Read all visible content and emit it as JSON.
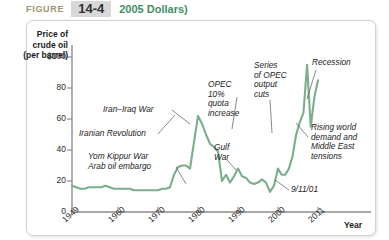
{
  "header": {
    "figure_word": "FIGURE",
    "figure_number": "14-4",
    "title": "2005 Dollars)",
    "colors": {
      "figure_word": "#9d9471",
      "figure_number_bg": "#d8d8d8",
      "title": "#3f8f66",
      "line": "#7aae8c"
    }
  },
  "chart_data": {
    "type": "line",
    "title": "2005 Dollars)",
    "xlabel": "Year",
    "ylabel": "Price of crude oil (per barrel)",
    "ylabel_lines": [
      "Price of",
      "crude oil",
      "(per barrel)"
    ],
    "ylim": [
      0,
      105
    ],
    "xlim": [
      1949,
      2011
    ],
    "yticks": [
      0,
      20,
      40,
      60,
      80,
      100
    ],
    "ytick_labels": [
      "0",
      "20",
      "40",
      "60",
      "80",
      "$100"
    ],
    "xticks": [
      1949,
      1960,
      1970,
      1980,
      1990,
      2000,
      2011
    ],
    "xtick_labels": [
      "1949",
      "1960",
      "1970",
      "1980",
      "1990",
      "2000",
      "2011"
    ],
    "grid": false,
    "legend": "none",
    "series": [
      {
        "name": "Real price of crude oil (2005 dollars per barrel)",
        "color": "#7aae8c",
        "x": [
          1949,
          1950,
          1951,
          1952,
          1953,
          1954,
          1955,
          1956,
          1957,
          1958,
          1959,
          1960,
          1961,
          1962,
          1963,
          1964,
          1965,
          1966,
          1967,
          1968,
          1969,
          1970,
          1971,
          1972,
          1973,
          1974,
          1975,
          1976,
          1977,
          1978,
          1979,
          1980,
          1981,
          1982,
          1983,
          1984,
          1985,
          1986,
          1987,
          1988,
          1989,
          1990,
          1991,
          1992,
          1993,
          1994,
          1995,
          1996,
          1997,
          1998,
          1999,
          2000,
          2001,
          2002,
          2003,
          2004,
          2005,
          2006,
          2007,
          2008,
          2009,
          2010,
          2011
        ],
        "y": [
          17,
          16,
          15,
          15,
          16,
          16,
          16,
          16,
          17,
          16,
          15,
          15,
          15,
          15,
          15,
          14,
          14,
          14,
          14,
          14,
          14,
          14,
          15,
          15,
          16,
          24,
          29,
          30,
          30,
          28,
          45,
          62,
          57,
          50,
          44,
          42,
          39,
          20,
          24,
          19,
          23,
          28,
          23,
          22,
          19,
          18,
          19,
          21,
          19,
          13,
          17,
          28,
          24,
          24,
          28,
          36,
          50,
          58,
          64,
          95,
          55,
          74,
          85
        ]
      }
    ],
    "annotations": [
      {
        "id": "yom-kippur",
        "text": "Yom Kippur War\nArab oil embargo",
        "lines": [
          "Yom Kippur War",
          "Arab oil embargo"
        ],
        "year": 1973,
        "value": 24
      },
      {
        "id": "iranian-revolution",
        "text": "Iranian Revolution",
        "lines": [
          "Iranian Revolution"
        ],
        "year": 1979,
        "value": 45
      },
      {
        "id": "iran-iraq-war",
        "text": "Iran–Iraq War",
        "lines": [
          "Iran–Iraq War"
        ],
        "year": 1980,
        "value": 62
      },
      {
        "id": "opec-quota",
        "text": "OPEC 10% quota increase",
        "lines": [
          "OPEC",
          "10%",
          "quota",
          "increase"
        ],
        "year": 1986,
        "value": 20
      },
      {
        "id": "gulf-war",
        "text": "Gulf War",
        "lines": [
          "Gulf",
          "War"
        ],
        "year": 1990,
        "value": 28
      },
      {
        "id": "opec-cuts",
        "text": "Series of OPEC output cuts",
        "lines": [
          "Series",
          "of OPEC",
          "output",
          "cuts"
        ],
        "year": 1999,
        "value": 17
      },
      {
        "id": "nine-eleven",
        "text": "9/11/01",
        "lines": [
          "9/11/01"
        ],
        "year": 2001,
        "value": 24
      },
      {
        "id": "recession",
        "text": "Recession",
        "lines": [
          "Recession"
        ],
        "year": 2009,
        "value": 55
      },
      {
        "id": "rising-demand",
        "text": "Rising world demand and Middle East tensions",
        "lines": [
          "Rising world",
          "demand and",
          "Middle East",
          "tensions"
        ],
        "year": 2008,
        "value": 95
      }
    ]
  }
}
